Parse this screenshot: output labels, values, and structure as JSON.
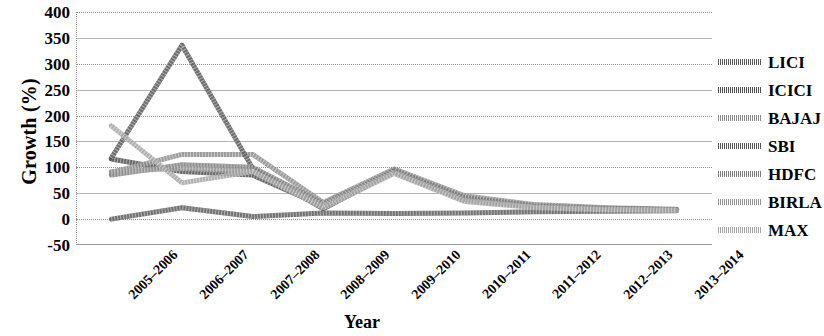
{
  "chart_data": {
    "type": "line",
    "title": "",
    "xlabel": "Year",
    "ylabel": "Growth (%)",
    "categories": [
      "2005–2006",
      "2006–2007",
      "2007–2008",
      "2008–2009",
      "2009–2010",
      "2010–2011",
      "2011–2012",
      "2012–2013",
      "2013–2014"
    ],
    "ylim": [
      -50,
      400
    ],
    "ytick_values": [
      400,
      350,
      300,
      250,
      200,
      150,
      100,
      50,
      0,
      -50
    ],
    "ytick_labels": [
      "400",
      "350",
      "300",
      "250",
      "200",
      "150",
      "100",
      "50",
      "0",
      "-50"
    ],
    "grid": true,
    "legend_position": "right",
    "series": [
      {
        "name": "LICI",
        "color": "#5a5a5a",
        "values": [
          0,
          22,
          5,
          12,
          11,
          12,
          14,
          15,
          16
        ]
      },
      {
        "name": "ICICI",
        "color": "#4f4f4f",
        "values": [
          116,
          92,
          85,
          25,
          95,
          40,
          25,
          20,
          18
        ]
      },
      {
        "name": "BAJAJ",
        "color": "#8c8c8c",
        "values": [
          90,
          125,
          125,
          32,
          97,
          45,
          28,
          22,
          19
        ]
      },
      {
        "name": "SBI",
        "color": "#555555",
        "values": [
          118,
          336,
          98,
          20,
          92,
          38,
          24,
          20,
          18
        ]
      },
      {
        "name": "HDFC",
        "color": "#7d7d7d",
        "values": [
          85,
          105,
          100,
          30,
          93,
          42,
          26,
          21,
          18
        ]
      },
      {
        "name": "BIRLA",
        "color": "#949494",
        "values": [
          92,
          98,
          92,
          26,
          90,
          36,
          23,
          19,
          17
        ]
      },
      {
        "name": "MAX",
        "color": "#a3a3a3",
        "values": [
          180,
          70,
          92,
          22,
          88,
          34,
          22,
          18,
          17
        ]
      }
    ]
  },
  "axes": {
    "y_title": "Growth (%)",
    "x_title": "Year"
  },
  "legend": {
    "items": [
      {
        "label": "LICI"
      },
      {
        "label": "ICICI"
      },
      {
        "label": "BAJAJ"
      },
      {
        "label": "SBI"
      },
      {
        "label": "HDFC"
      },
      {
        "label": "BIRLA"
      },
      {
        "label": "MAX"
      }
    ]
  }
}
